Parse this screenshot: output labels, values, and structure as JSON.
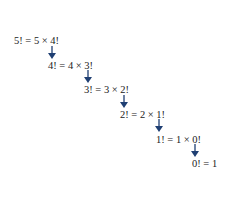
{
  "diagram": {
    "steps": [
      {
        "label": "5! = 5 × 4!"
      },
      {
        "label": "4! = 4 × 3!"
      },
      {
        "label": "3! = 3 × 2!"
      },
      {
        "label": "2! = 2 × 1!"
      },
      {
        "label": "1! = 1 × 0!"
      },
      {
        "label": "0! = 1"
      }
    ],
    "arrow_color": "#1f3f73"
  }
}
